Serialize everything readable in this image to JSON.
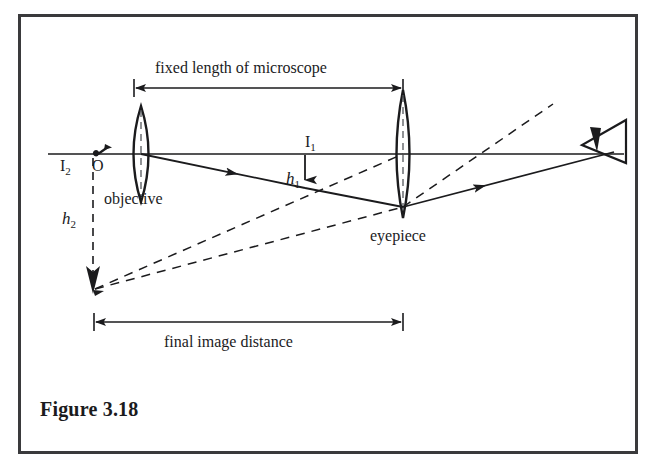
{
  "figure": {
    "caption": "Figure 3.18",
    "frame_color": "#3a3a3c",
    "ink_color": "#1b1b1d",
    "background": "#ffffff"
  },
  "dimensions": [
    {
      "id": "fixed-length",
      "label": "fixed length of microscope",
      "from_x": 133,
      "to_x": 403,
      "y": 88,
      "style": "double-headed-arrow"
    },
    {
      "id": "final-image-distance",
      "label": "final image distance",
      "from_x": 93,
      "to_x": 403,
      "y": 322,
      "style": "double-headed-arrow"
    }
  ],
  "labels": [
    {
      "id": "object-point",
      "text": "O",
      "x": 92,
      "y": 163,
      "style": "plain"
    },
    {
      "id": "image-one",
      "text": "I",
      "sub": "1",
      "x": 307,
      "y": 140,
      "style": "sub"
    },
    {
      "id": "image-two",
      "text": "I",
      "sub": "2",
      "x": 61,
      "y": 163,
      "style": "sub"
    },
    {
      "id": "height-one",
      "text": "h",
      "sub": "1",
      "x": 289,
      "y": 177,
      "style": "italic"
    },
    {
      "id": "height-two",
      "text": "h",
      "sub": "2",
      "x": 64,
      "y": 215,
      "style": "italic"
    },
    {
      "id": "objective-lens",
      "text": "objective",
      "x": 98,
      "y": 196,
      "style": "plain"
    },
    {
      "id": "eyepiece-lens",
      "text": "eyepiece",
      "x": 360,
      "y": 232,
      "style": "plain"
    }
  ],
  "optical_axis": {
    "y": 154,
    "from_x": 48,
    "to_x": 624
  },
  "lenses": [
    {
      "id": "objective",
      "cx": 141,
      "cy": 154,
      "half_height": 48,
      "half_width": 13
    },
    {
      "id": "eyepiece",
      "cx": 403,
      "cy": 154,
      "half_height": 64,
      "half_width": 11
    }
  ],
  "eye": {
    "cx": 600,
    "cy": 144,
    "facing": "left"
  },
  "rays": {
    "object_arrow": {
      "x": 104,
      "base_y": 154,
      "tip_y": 145
    },
    "solid": [
      {
        "id": "objective-to-I1-to-eyepiece",
        "points": "141,154 305,188 403,207"
      },
      {
        "id": "eyepiece-to-eye",
        "points": "403,207 612,152"
      }
    ],
    "dashed": [
      {
        "id": "virtual-upper",
        "points": "403,207 551,106"
      },
      {
        "id": "virtual-from-I2-a",
        "points": "92,290 403,154"
      },
      {
        "id": "virtual-from-I2-b",
        "points": "92,290 403,207"
      }
    ],
    "h1_arrow": {
      "x": 305,
      "from_y": 154,
      "to_y": 190
    },
    "h2_arrow": {
      "x": 92,
      "from_y": 160,
      "to_y": 292
    }
  }
}
